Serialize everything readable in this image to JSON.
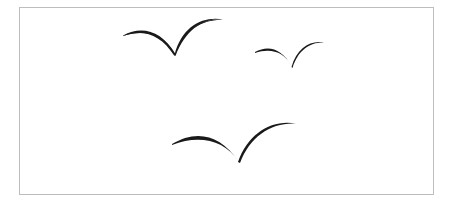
{
  "image": {
    "description": "Three black flying birds (seagull silhouettes) inside a thin gray bordered frame",
    "colors": {
      "background": "#ffffff",
      "border": "#bdbdbd",
      "bird": "#1a1a1a"
    },
    "birds": [
      {
        "name": "bird-top-left",
        "left": [
          123,
          36
        ],
        "vertex": [
          175,
          55
        ],
        "right": [
          222,
          19
        ]
      },
      {
        "name": "bird-top-right",
        "left": [
          255,
          52
        ],
        "vertex": [
          292,
          67
        ],
        "right": [
          323,
          42
        ]
      },
      {
        "name": "bird-bottom",
        "left": [
          172,
          144
        ],
        "vertex": [
          239,
          162
        ],
        "right": [
          295,
          123
        ]
      }
    ]
  }
}
